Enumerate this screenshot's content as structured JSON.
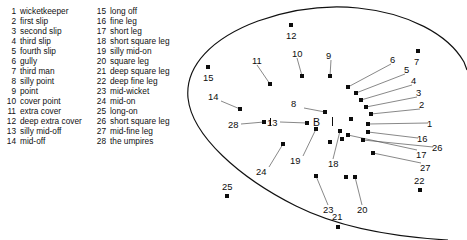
{
  "legend": {
    "left_column": [
      {
        "num": "1",
        "label": "wicketkeeper"
      },
      {
        "num": "2",
        "label": "first slip"
      },
      {
        "num": "3",
        "label": "second slip"
      },
      {
        "num": "4",
        "label": "third slip"
      },
      {
        "num": "5",
        "label": "fourth slip"
      },
      {
        "num": "6",
        "label": "gully"
      },
      {
        "num": "7",
        "label": "third man"
      },
      {
        "num": "8",
        "label": "silly point"
      },
      {
        "num": "9",
        "label": "point"
      },
      {
        "num": "10",
        "label": "cover point"
      },
      {
        "num": "11",
        "label": "extra cover"
      },
      {
        "num": "12",
        "label": "deep extra cover"
      },
      {
        "num": "13",
        "label": "silly mid-off"
      },
      {
        "num": "14",
        "label": "mid-off"
      }
    ],
    "right_column": [
      {
        "num": "15",
        "label": "long off"
      },
      {
        "num": "16",
        "label": "fine leg"
      },
      {
        "num": "17",
        "label": "short leg"
      },
      {
        "num": "18",
        "label": "short square leg"
      },
      {
        "num": "19",
        "label": "silly mid-on"
      },
      {
        "num": "20",
        "label": "square leg"
      },
      {
        "num": "21",
        "label": "deep square leg"
      },
      {
        "num": "22",
        "label": "deep fine leg"
      },
      {
        "num": "23",
        "label": "mid-wicket"
      },
      {
        "num": "24",
        "label": "mid-on"
      },
      {
        "num": "25",
        "label": "long-on"
      },
      {
        "num": "26",
        "label": "short square leg"
      },
      {
        "num": "27",
        "label": "mid-fine leg"
      },
      {
        "num": "28",
        "label": "the umpires"
      }
    ]
  },
  "field": {
    "batsman_marker": "B",
    "boundary_color": "#111111",
    "marker_color": "#0d0d0d",
    "positions": [
      {
        "num": "1",
        "name": "wicketkeeper",
        "mx": 188,
        "my": 124,
        "lx": 247,
        "ly": 119,
        "leader": true
      },
      {
        "num": "2",
        "name": "first slip",
        "mx": 191,
        "my": 114,
        "lx": 239,
        "ly": 100,
        "leader": true
      },
      {
        "num": "3",
        "name": "second slip",
        "mx": 186,
        "my": 107,
        "lx": 236,
        "ly": 88,
        "leader": true
      },
      {
        "num": "4",
        "name": "third slip",
        "mx": 181,
        "my": 100,
        "lx": 231,
        "ly": 76,
        "leader": true
      },
      {
        "num": "5",
        "name": "fourth slip",
        "mx": 176,
        "my": 93,
        "lx": 224,
        "ly": 65,
        "leader": true
      },
      {
        "num": "6",
        "name": "gully",
        "mx": 168,
        "my": 87,
        "lx": 210,
        "ly": 55,
        "leader": true
      },
      {
        "num": "7",
        "name": "third man",
        "mx": 238,
        "my": 51,
        "lx": 234,
        "ly": 57,
        "leader": false
      },
      {
        "num": "8",
        "name": "silly point",
        "mx": 145,
        "my": 112,
        "lx": 111,
        "ly": 99,
        "leader": true
      },
      {
        "num": "9",
        "name": "point",
        "mx": 150,
        "my": 76,
        "lx": 146,
        "ly": 51,
        "leader": true
      },
      {
        "num": "10",
        "name": "cover point",
        "mx": 122,
        "my": 76,
        "lx": 112,
        "ly": 49,
        "leader": true
      },
      {
        "num": "11",
        "name": "extra cover",
        "mx": 90,
        "my": 84,
        "lx": 72,
        "ly": 56,
        "leader": true
      },
      {
        "num": "12",
        "name": "deep extra cover",
        "mx": 111,
        "my": 25,
        "lx": 106,
        "ly": 31,
        "leader": false
      },
      {
        "num": "13",
        "name": "silly mid-off",
        "mx": 127,
        "my": 123,
        "lx": 87,
        "ly": 118,
        "leader": true
      },
      {
        "num": "14",
        "name": "mid-off",
        "mx": 60,
        "my": 109,
        "lx": 28,
        "ly": 92,
        "leader": true
      },
      {
        "num": "15",
        "name": "long off",
        "mx": 28,
        "my": 67,
        "lx": 23,
        "ly": 73,
        "leader": false
      },
      {
        "num": "16",
        "name": "fine leg",
        "mx": 188,
        "my": 132,
        "lx": 237,
        "ly": 134,
        "leader": true
      },
      {
        "num": "17",
        "name": "short leg",
        "mx": 168,
        "my": 135,
        "lx": 236,
        "ly": 150,
        "leader": true
      },
      {
        "num": "18",
        "name": "short square leg",
        "mx": 160,
        "my": 131,
        "lx": 148,
        "ly": 159,
        "leader": true
      },
      {
        "num": "19",
        "name": "silly mid-on",
        "mx": 136,
        "my": 129,
        "lx": 110,
        "ly": 156,
        "leader": true
      },
      {
        "num": "20",
        "name": "square leg",
        "mx": 175,
        "my": 177,
        "lx": 177,
        "ly": 205,
        "leader": true
      },
      {
        "num": "21",
        "name": "deep square leg",
        "mx": 158,
        "my": 227,
        "lx": 152,
        "ly": 212,
        "leader": false
      },
      {
        "num": "22",
        "name": "deep fine leg",
        "mx": 240,
        "my": 190,
        "lx": 234,
        "ly": 176,
        "leader": false
      },
      {
        "num": "23",
        "name": "mid-wicket",
        "mx": 136,
        "my": 176,
        "lx": 143,
        "ly": 205,
        "leader": true
      },
      {
        "num": "24",
        "name": "mid-on",
        "mx": 103,
        "my": 144,
        "lx": 76,
        "ly": 167,
        "leader": true
      },
      {
        "num": "25",
        "name": "long-on",
        "mx": 47,
        "my": 196,
        "lx": 42,
        "ly": 182,
        "leader": false
      },
      {
        "num": "26",
        "name": "short square leg",
        "mx": 183,
        "my": 140,
        "lx": 252,
        "ly": 143,
        "leader": true
      },
      {
        "num": "27",
        "name": "mid-fine leg",
        "mx": 193,
        "my": 153,
        "lx": 240,
        "ly": 163,
        "leader": true
      },
      {
        "num": "28",
        "name": "the umpires",
        "mx": 84,
        "my": 122,
        "lx": 48,
        "ly": 120,
        "leader": true
      }
    ],
    "extra_markers": [
      {
        "name": "umpire-bowler-end",
        "mx": 162,
        "my": 139
      },
      {
        "name": "batsman-runner",
        "mx": 150,
        "my": 142
      },
      {
        "name": "leg-side-inner",
        "mx": 171,
        "my": 119
      },
      {
        "name": "on-side-fielder",
        "mx": 166,
        "my": 177
      }
    ]
  }
}
